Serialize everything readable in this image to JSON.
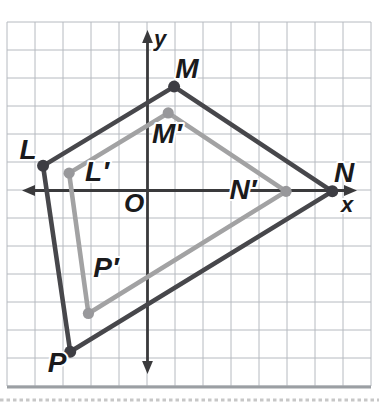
{
  "figure": {
    "width": 379,
    "height": 405,
    "background": "#ffffff",
    "label_color": "#1a1a1c",
    "grid": {
      "left": 7,
      "top": 22,
      "cell": 28,
      "cols": 13,
      "rows": 13,
      "line_color": "#b6bac0",
      "bottom_shadow_color": "#9b9fa3"
    },
    "axes": {
      "color": "#3a3a3c",
      "stroke_width": 2.8,
      "origin_x": 147.5,
      "origin_y": 190.5,
      "unit": 28,
      "x_label": "x",
      "y_label": "y",
      "origin_label": "O",
      "x_label_pos": {
        "x": 347,
        "y": 204
      },
      "y_label_pos": {
        "x": 160,
        "y": 38
      },
      "origin_label_pos": {
        "x": 134,
        "y": 203
      },
      "x_tip_left": 22,
      "x_tip_right": 357,
      "y_tip_top": 30,
      "y_tip_bottom": 374
    },
    "polygons": [
      {
        "name": "L′M′N′P′",
        "role": "image",
        "stroke": "#a2a2a3",
        "dot_fill": "#98989b",
        "dot_radius": 5.6,
        "stroke_width": 4.6,
        "vertices": [
          {
            "label": "L′",
            "gx": -2.8,
            "gy": 0.62,
            "label_pos": {
              "x": 97,
              "y": 171
            }
          },
          {
            "label": "M′",
            "gx": 0.74,
            "gy": 2.77,
            "label_pos": {
              "x": 167,
              "y": 133
            }
          },
          {
            "label": "N′",
            "gx": 4.95,
            "gy": -0.03,
            "label_pos": {
              "x": 243,
              "y": 189
            }
          },
          {
            "label": "P′",
            "gx": -2.11,
            "gy": -4.39,
            "label_pos": {
              "x": 106,
              "y": 267
            }
          }
        ]
      },
      {
        "name": "LMNP",
        "role": "preimage",
        "stroke": "#47474b",
        "dot_fill": "#3d3d43",
        "dot_radius": 6,
        "stroke_width": 4.6,
        "vertices": [
          {
            "label": "L",
            "gx": -3.73,
            "gy": 0.88,
            "label_pos": {
              "x": 28,
              "y": 149
            }
          },
          {
            "label": "M",
            "gx": 0.95,
            "gy": 3.71,
            "label_pos": {
              "x": 187,
              "y": 68
            }
          },
          {
            "label": "N",
            "gx": 6.6,
            "gy": -0.03,
            "label_pos": {
              "x": 344,
              "y": 172
            }
          },
          {
            "label": "P",
            "gx": -2.76,
            "gy": -5.76,
            "label_pos": {
              "x": 57,
              "y": 362
            }
          }
        ]
      }
    ],
    "bottom_edge_dots": {
      "y": 400,
      "color": "#c7c7c7"
    }
  }
}
